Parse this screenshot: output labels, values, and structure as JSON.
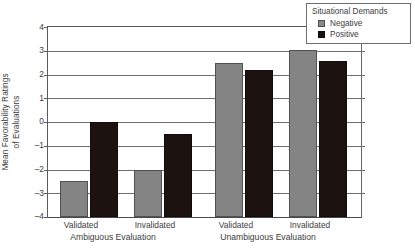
{
  "chart_data": {
    "type": "bar",
    "title": "",
    "subtitle": "",
    "xlabel": "",
    "ylabel": "Mean Favorability Ratings of Evaluations",
    "ylabel_lines": [
      "Mean Favorability Ratings",
      "of Evaluations"
    ],
    "ylim": [
      -4,
      4
    ],
    "yticks": [
      4,
      3,
      2,
      1,
      0,
      -1,
      -2,
      -3,
      -4
    ],
    "ytick_labels": [
      "4",
      "3",
      "2",
      "1",
      "0",
      "–1",
      "–2",
      "–3",
      "–4"
    ],
    "grid": true,
    "grid_axis": "y",
    "legend_position": "top-right",
    "legend_title": "Situational Demands",
    "categories": [
      "Validated",
      "Invalidated",
      "Validated",
      "Invalidated"
    ],
    "group_titles": [
      "Ambiguous Evaluation",
      "Unambiguous Evaluation"
    ],
    "groups": [
      {
        "title": "Ambiguous Evaluation",
        "categories": [
          "Validated",
          "Invalidated"
        ]
      },
      {
        "title": "Unambiguous Evaluation",
        "categories": [
          "Validated",
          "Invalidated"
        ]
      }
    ],
    "series": [
      {
        "name": "Negative",
        "color": "#848484",
        "values": [
          -2.5,
          -2.0,
          2.5,
          3.05
        ]
      },
      {
        "name": "Positive",
        "color": "#1c1310",
        "values": [
          0.0,
          -0.5,
          2.2,
          2.55
        ]
      }
    ],
    "annotations": []
  },
  "legend": {
    "title": "Situational Demands",
    "entries": [
      {
        "label": "Negative",
        "swatch": "gray-swatch-icon"
      },
      {
        "label": "Positive",
        "swatch": "black-swatch-icon"
      }
    ]
  },
  "axes": {
    "y_title_line1": "Mean Favorability Ratings",
    "y_title_line2": "of Evaluations",
    "y_tick_labels": [
      "4",
      "3",
      "2",
      "1",
      "0",
      "–1",
      "–2",
      "–3",
      "–4"
    ],
    "x_tick_labels": [
      "Validated",
      "Invalidated",
      "Validated",
      "Invalidated"
    ],
    "x_group_labels": [
      "Ambiguous Evaluation",
      "Unambiguous Evaluation"
    ]
  },
  "colors": {
    "negative_series": "#848484",
    "positive_series": "#1c1310",
    "axis": "#5a5a5a",
    "grid": "#6d6d6d",
    "text": "#3c3c3c",
    "background": "#ffffff"
  }
}
